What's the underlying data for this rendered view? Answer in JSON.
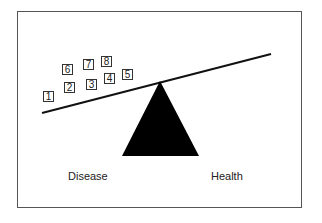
{
  "diagram": {
    "type": "balance-scale",
    "labels": {
      "left": "Disease",
      "right": "Health"
    },
    "weights": [
      {
        "label": "1",
        "x": 43,
        "y": 91
      },
      {
        "label": "2",
        "x": 64,
        "y": 82
      },
      {
        "label": "3",
        "x": 86,
        "y": 79
      },
      {
        "label": "4",
        "x": 104,
        "y": 73
      },
      {
        "label": "5",
        "x": 122,
        "y": 69
      },
      {
        "label": "6",
        "x": 62,
        "y": 64
      },
      {
        "label": "7",
        "x": 83,
        "y": 59
      },
      {
        "label": "8",
        "x": 101,
        "y": 56
      }
    ],
    "colors": {
      "fulcrum": "#000000",
      "beam": "#111111",
      "frame": "#555555"
    }
  }
}
